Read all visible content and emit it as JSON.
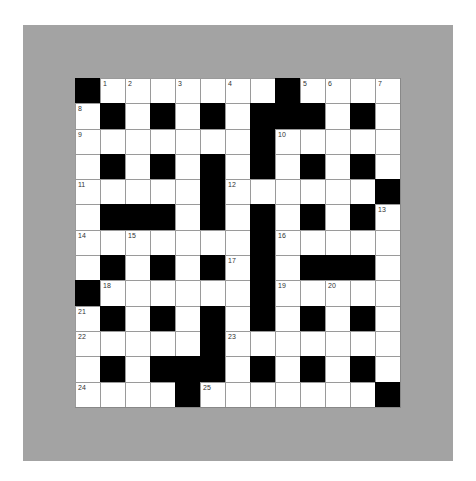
{
  "colors": {
    "page_background": "#ffffff",
    "panel_background": "#a3a3a3",
    "cell_white": "#ffffff",
    "cell_black": "#000000",
    "grid_line": "#9a9a9a"
  },
  "crossword": {
    "rows": 13,
    "cols": 13,
    "layout": [
      "#....... #....",
      "x"
    ],
    "grid": [
      [
        "#",
        "1",
        "2",
        ".",
        "3",
        ".",
        "4",
        ".",
        "#",
        "5",
        "6",
        ".",
        "7"
      ],
      [
        "8",
        "#",
        ".",
        "#",
        ".",
        "#",
        ".",
        "#",
        "#",
        "#",
        ".",
        "#",
        "."
      ],
      [
        "9",
        ".",
        ".",
        ".",
        ".",
        ".",
        ".",
        "#",
        "10",
        ".",
        ".",
        ".",
        "."
      ],
      [
        ".",
        "#",
        ".",
        "#",
        ".",
        "#",
        ".",
        "#",
        ".",
        "#",
        ".",
        "#",
        "."
      ],
      [
        "11",
        ".",
        ".",
        ".",
        ".",
        "#",
        "12",
        ".",
        ".",
        ".",
        ".",
        ".",
        "#"
      ],
      [
        ".",
        "#",
        "#",
        "#",
        ".",
        "#",
        ".",
        "#",
        ".",
        "#",
        ".",
        "#",
        "13"
      ],
      [
        "14",
        ".",
        "15",
        ".",
        ".",
        ".",
        ".",
        "#",
        "16",
        ".",
        ".",
        ".",
        "."
      ],
      [
        ".",
        "#",
        ".",
        "#",
        ".",
        "#",
        "17",
        "#",
        ".",
        "#",
        "#",
        "#",
        "."
      ],
      [
        "#",
        "18",
        ".",
        ".",
        ".",
        ".",
        ".",
        "#",
        "19",
        ".",
        "20",
        ".",
        "."
      ],
      [
        "21",
        "#",
        ".",
        "#",
        ".",
        "#",
        ".",
        "#",
        ".",
        "#",
        ".",
        "#",
        "."
      ],
      [
        "22",
        ".",
        ".",
        ".",
        ".",
        "#",
        "23",
        ".",
        ".",
        ".",
        ".",
        ".",
        "."
      ],
      [
        ".",
        "#",
        ".",
        "#",
        "#",
        "#",
        ".",
        "#",
        ".",
        "#",
        ".",
        "#",
        "."
      ],
      [
        "24",
        ".",
        ".",
        ".",
        "#",
        "25",
        ".",
        ".",
        ".",
        ".",
        ".",
        ".",
        "#"
      ]
    ],
    "clue_numbers": [
      "1",
      "2",
      "3",
      "4",
      "5",
      "6",
      "7",
      "8",
      "9",
      "10",
      "11",
      "12",
      "13",
      "14",
      "15",
      "16",
      "17",
      "18",
      "19",
      "20",
      "21",
      "22",
      "23",
      "24",
      "25"
    ]
  }
}
